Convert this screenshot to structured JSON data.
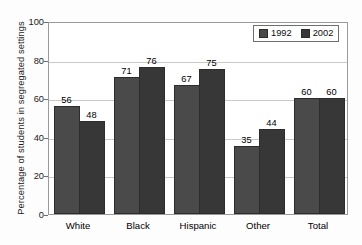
{
  "chart_data": {
    "type": "bar",
    "title": "",
    "subtitle": "",
    "xlabel": "",
    "ylabel": "Percentage of students in segregated settings",
    "categories": [
      "White",
      "Black",
      "Hispanic",
      "Other",
      "Total"
    ],
    "series": [
      {
        "name": "1992",
        "color": "#4a4a4a",
        "values": [
          56,
          71,
          67,
          35,
          60
        ]
      },
      {
        "name": "2002",
        "color": "#373737",
        "values": [
          48,
          76,
          75,
          44,
          60
        ]
      }
    ],
    "ylim": [
      0,
      100
    ],
    "yticks": [
      0,
      20,
      40,
      60,
      80,
      100
    ],
    "ytick_labels": [
      "0",
      "20",
      "40",
      "60",
      "80",
      "100"
    ],
    "grid": true,
    "grid_axis": "y",
    "legend_position": "top-right",
    "data_labels": true
  },
  "legend": {
    "entries": [
      {
        "label": "1992"
      },
      {
        "label": "2002"
      }
    ]
  },
  "axes": {
    "y_title": "Percentage of students in segregated settings"
  }
}
